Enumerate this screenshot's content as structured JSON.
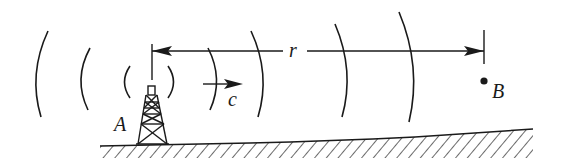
{
  "diagram": {
    "type": "wave-propagation",
    "labels": {
      "source": "A",
      "receiver": "B",
      "distance": "r",
      "speed": "c"
    },
    "colors": {
      "ink": "#1a1a1a",
      "background": "#ffffff"
    },
    "elements": {
      "transmitter": "radio-tower",
      "wavefronts": 8,
      "ground": "hatched-terrain"
    }
  }
}
